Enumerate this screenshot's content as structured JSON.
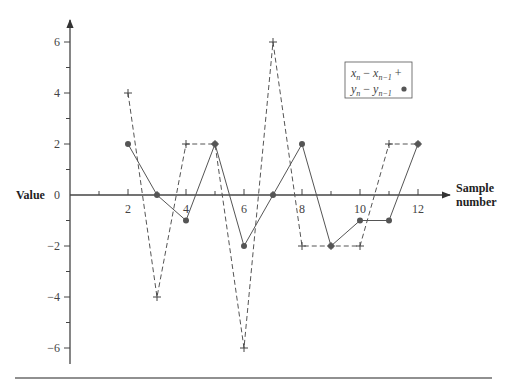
{
  "chart_data": {
    "type": "line",
    "title": "",
    "xlabel": "Sample number",
    "ylabel": "Value",
    "x": [
      2,
      3,
      4,
      5,
      6,
      7,
      8,
      9,
      10,
      11,
      12
    ],
    "x_ticks": [
      "2",
      "4",
      "6",
      "8",
      "10",
      "12"
    ],
    "y_ticks": [
      "6",
      "4",
      "2",
      "0",
      "−2",
      "−4",
      "−6"
    ],
    "ylim": [
      -6,
      6
    ],
    "xlim": [
      0,
      13
    ],
    "grid": false,
    "legend_position": "upper right",
    "series": [
      {
        "name": "x_n − x_{n−1}",
        "marker": "+",
        "line_style": "dashed",
        "values": [
          4,
          -4,
          2,
          2,
          -6,
          6,
          -2,
          -2,
          -2,
          2,
          2
        ]
      },
      {
        "name": "y_n − y_{n−1}",
        "marker": "dot",
        "line_style": "solid",
        "values": [
          2,
          0,
          -1,
          2,
          -2,
          0,
          2,
          -2,
          -1,
          -1,
          2
        ]
      }
    ]
  },
  "axes": {
    "x_title_line1": "Sample",
    "x_title_line2": "number",
    "y_title": "Value"
  },
  "legend": {
    "items": [
      {
        "var": "x",
        "sub": "n",
        "sub2": "n−1",
        "marker": "+"
      },
      {
        "var": "y",
        "sub": "n",
        "sub2": "n−1",
        "marker": "●"
      }
    ]
  }
}
